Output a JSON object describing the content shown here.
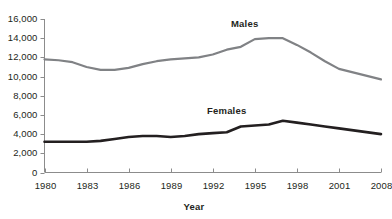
{
  "chart_data": {
    "type": "line",
    "title": "",
    "xlabel": "Year",
    "ylabel": "",
    "grid": false,
    "legend_position": "inline-annotation",
    "x": [
      1980,
      1981,
      1982,
      1983,
      1984,
      1985,
      1986,
      1987,
      1988,
      1989,
      1990,
      1991,
      1992,
      1993,
      1994,
      1995,
      1996,
      1997,
      1998,
      1999,
      2000,
      2001,
      2008
    ],
    "xtick_labels": [
      "1980",
      "1983",
      "1986",
      "1989",
      "1992",
      "1995",
      "1998",
      "2001",
      "2008"
    ],
    "xtick_values": [
      1980,
      1983,
      1986,
      1989,
      1992,
      1995,
      1998,
      2001,
      2008
    ],
    "ytick_labels": [
      "0",
      "2,000",
      "4,000",
      "6,000",
      "8,000",
      "10,000",
      "12,000",
      "14,000",
      "16,000"
    ],
    "ytick_values": [
      0,
      2000,
      4000,
      6000,
      8000,
      10000,
      12000,
      14000,
      16000
    ],
    "ylim": [
      0,
      16000
    ],
    "xlim": [
      1980,
      2008
    ],
    "series": [
      {
        "name": "Males",
        "color": "#808285",
        "line_width": 2.2,
        "label": "Males",
        "values": [
          11800,
          11700,
          11500,
          11000,
          10700,
          10700,
          10900,
          11300,
          11600,
          11800,
          11900,
          12000,
          12300,
          12800,
          13100,
          13900,
          14000,
          14000,
          13300,
          12500,
          11600,
          10800,
          9700
        ]
      },
      {
        "name": "Females",
        "color": "#231f20",
        "line_width": 2.6,
        "label": "Females",
        "values": [
          3200,
          3200,
          3200,
          3200,
          3300,
          3500,
          3700,
          3800,
          3800,
          3700,
          3800,
          4000,
          4100,
          4200,
          4800,
          4900,
          5000,
          5400,
          5200,
          5000,
          4800,
          4600,
          4000
        ]
      }
    ]
  },
  "axis": {
    "x_title": "Year"
  }
}
